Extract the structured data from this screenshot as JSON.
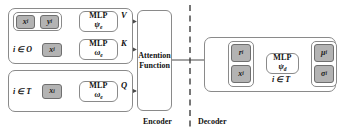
{
  "diagram": {
    "colors": {
      "chip_fill": "#b3b3b3",
      "chip_border": "#6f6f6f",
      "box_border": "#8a8a8a",
      "line": "#555555",
      "text": "#111111",
      "background": "#ffffff"
    },
    "sections": [
      {
        "id": "encoder",
        "caption": "Encoder"
      },
      {
        "id": "decoder",
        "caption": "Decoder"
      }
    ],
    "encoder": {
      "context_group": {
        "set_label": "i ∈ O",
        "value_path": {
          "inputs": [
            {
              "symbol": "x",
              "subscript": "i"
            },
            {
              "symbol": "y",
              "subscript": "i"
            }
          ],
          "mlp": {
            "title": "MLP",
            "subscript_symbol": "ψ",
            "subscript_index": "e"
          },
          "edge_label": "V"
        },
        "key_path": {
          "inputs": [
            {
              "symbol": "x",
              "subscript": "i"
            }
          ],
          "mlp": {
            "title": "MLP",
            "subscript_symbol": "ω",
            "subscript_index": "e"
          },
          "edge_label": "K"
        }
      },
      "target_group": {
        "set_label": "i ∈ T",
        "query_path": {
          "inputs": [
            {
              "symbol": "x",
              "subscript": "i"
            }
          ],
          "mlp": {
            "title": "MLP",
            "subscript_symbol": "ω",
            "subscript_index": "e"
          },
          "edge_label": "Q"
        }
      },
      "attention": {
        "line1": "Attention",
        "line2": "Function"
      }
    },
    "decoder": {
      "set_label": "i ∈ T",
      "inputs": [
        {
          "symbol": "r",
          "subscript": "i"
        },
        {
          "symbol": "x",
          "subscript": "i"
        }
      ],
      "mlp": {
        "title": "MLP",
        "subscript_symbol": "ψ",
        "subscript_index": "d"
      },
      "outputs": [
        {
          "symbol": "μ",
          "subscript": "i"
        },
        {
          "symbol": "σ",
          "subscript": "i"
        }
      ]
    }
  }
}
